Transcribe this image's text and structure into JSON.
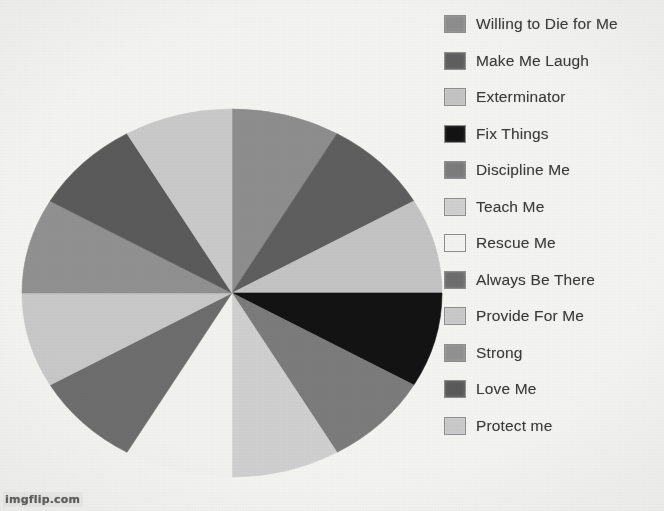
{
  "watermark": {
    "text": "imgflip.com"
  },
  "legend": {
    "items": [
      {
        "label": "Willing to Die for Me",
        "color": "#8d8d8d"
      },
      {
        "label": "Make Me Laugh",
        "color": "#5e5e5e"
      },
      {
        "label": "Exterminator",
        "color": "#c3c3c3"
      },
      {
        "label": "Fix Things",
        "color": "#131313"
      },
      {
        "label": "Discipline Me",
        "color": "#7b7b7b"
      },
      {
        "label": "Teach Me",
        "color": "#cfcfcf"
      },
      {
        "label": "Rescue Me",
        "color": "#f1f1ef"
      },
      {
        "label": "Always Be There",
        "color": "#6d6d6d"
      },
      {
        "label": "Provide For Me",
        "color": "#c8c8c8"
      },
      {
        "label": "Strong",
        "color": "#909090"
      },
      {
        "label": "Love Me",
        "color": "#5a5a5a"
      },
      {
        "label": "Protect me",
        "color": "#c9c9c9"
      }
    ]
  },
  "chart_data": {
    "type": "pie",
    "title": "",
    "legend_position": "right",
    "grid": false,
    "total": 100,
    "slice_count": 12,
    "start_angle_deg": 0,
    "direction": "clockwise",
    "center": {
      "x": 232,
      "y": 293
    },
    "radius": {
      "rx": 210,
      "ry": 184
    },
    "categories": [
      "Willing to Die for Me",
      "Make Me Laugh",
      "Exterminator",
      "Fix Things",
      "Discipline Me",
      "Teach Me",
      "Rescue Me",
      "Always Be There",
      "Provide For Me",
      "Strong",
      "Love Me",
      "Protect me"
    ],
    "values": [
      8.33,
      8.33,
      8.33,
      8.33,
      8.33,
      8.33,
      8.33,
      8.33,
      8.33,
      8.33,
      8.33,
      8.33
    ],
    "angles_deg": [
      30,
      30,
      30,
      30,
      30,
      30,
      30,
      30,
      30,
      30,
      30,
      30
    ],
    "colors": [
      "#8d8d8d",
      "#5e5e5e",
      "#c3c3c3",
      "#131313",
      "#7b7b7b",
      "#cfcfcf",
      "#f1f1ef",
      "#6d6d6d",
      "#c8c8c8",
      "#909090",
      "#5a5a5a",
      "#c9c9c9"
    ],
    "slices": [
      {
        "label": "Willing to Die for Me",
        "value": 8.33,
        "color": "#8d8d8d",
        "start_deg": 0,
        "end_deg": 30
      },
      {
        "label": "Make Me Laugh",
        "value": 8.33,
        "color": "#5e5e5e",
        "start_deg": 30,
        "end_deg": 60
      },
      {
        "label": "Exterminator",
        "value": 8.33,
        "color": "#c3c3c3",
        "start_deg": 60,
        "end_deg": 90
      },
      {
        "label": "Fix Things",
        "value": 8.33,
        "color": "#131313",
        "start_deg": 90,
        "end_deg": 120
      },
      {
        "label": "Discipline Me",
        "value": 8.33,
        "color": "#7b7b7b",
        "start_deg": 120,
        "end_deg": 150
      },
      {
        "label": "Teach Me",
        "value": 8.33,
        "color": "#cfcfcf",
        "start_deg": 150,
        "end_deg": 180
      },
      {
        "label": "Rescue Me",
        "value": 8.33,
        "color": "#f1f1ef",
        "start_deg": 180,
        "end_deg": 210
      },
      {
        "label": "Always Be There",
        "value": 8.33,
        "color": "#6d6d6d",
        "start_deg": 210,
        "end_deg": 240
      },
      {
        "label": "Provide For Me",
        "value": 8.33,
        "color": "#c8c8c8",
        "start_deg": 240,
        "end_deg": 270
      },
      {
        "label": "Strong",
        "value": 8.33,
        "color": "#909090",
        "start_deg": 270,
        "end_deg": 300
      },
      {
        "label": "Love Me",
        "value": 8.33,
        "color": "#5a5a5a",
        "start_deg": 300,
        "end_deg": 330
      },
      {
        "label": "Protect me",
        "value": 8.33,
        "color": "#c9c9c9",
        "start_deg": 330,
        "end_deg": 360
      }
    ]
  }
}
